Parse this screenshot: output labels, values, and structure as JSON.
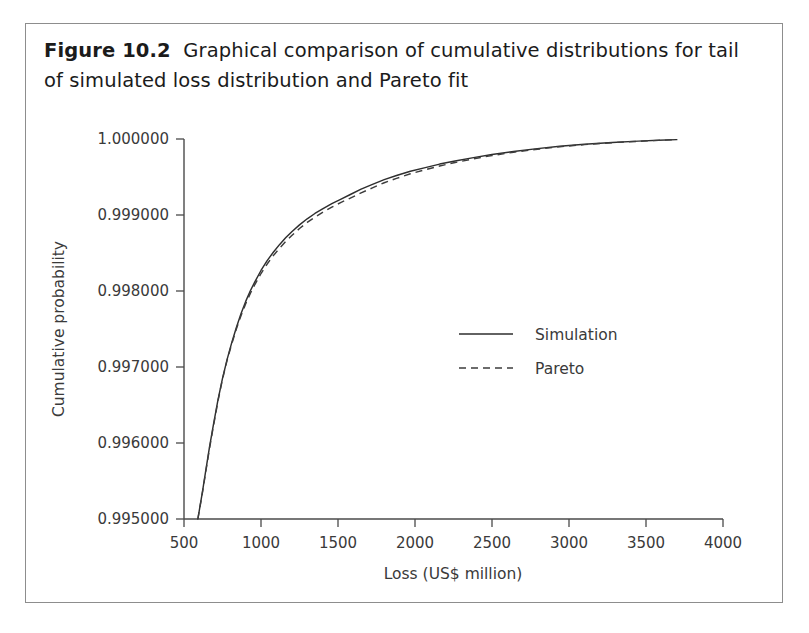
{
  "figure": {
    "caption_label": "Figure 10.2",
    "caption_text": "Graphical comparison of cumulative distributions for tail of simulated loss distribution and Pareto fit"
  },
  "chart_data": {
    "type": "line",
    "title": "",
    "xlabel": "Loss (US$ million)",
    "ylabel": "Cumulative probability",
    "xlim": [
      500,
      4000
    ],
    "ylim": [
      0.995,
      1.0
    ],
    "xticks": [
      500,
      1000,
      1500,
      2000,
      2500,
      3000,
      3500,
      4000
    ],
    "xtick_labels": [
      "500",
      "1000",
      "1500",
      "2000",
      "2500",
      "3000",
      "3500",
      "4000"
    ],
    "yticks": [
      0.995,
      0.996,
      0.997,
      0.998,
      0.999,
      1.0
    ],
    "ytick_labels": [
      "0.995000",
      "0.996000",
      "0.997000",
      "0.998000",
      "0.999000",
      "1.000000"
    ],
    "grid": false,
    "legend_position": "center-right",
    "series": [
      {
        "name": "Simulation",
        "style": "solid",
        "color": "#2e2e2e",
        "x": [
          590,
          605,
          620,
          640,
          665,
          690,
          720,
          750,
          780,
          810,
          840,
          870,
          900,
          930,
          960,
          1000,
          1040,
          1080,
          1120,
          1160,
          1200,
          1250,
          1300,
          1350,
          1400,
          1460,
          1520,
          1580,
          1650,
          1720,
          1800,
          1880,
          1970,
          2060,
          2160,
          2260,
          2380,
          2500,
          2640,
          2780,
          2940,
          3100,
          3280,
          3450,
          3580,
          3700
        ],
        "y": [
          0.995,
          0.99518,
          0.99536,
          0.99562,
          0.99594,
          0.99623,
          0.99656,
          0.99685,
          0.9971,
          0.99732,
          0.99752,
          0.9977,
          0.99786,
          0.998,
          0.99812,
          0.99827,
          0.9984,
          0.99851,
          0.99861,
          0.9987,
          0.99878,
          0.99887,
          0.99895,
          0.99902,
          0.99908,
          0.99915,
          0.99921,
          0.99927,
          0.99934,
          0.9994,
          0.999465,
          0.99952,
          0.999575,
          0.99962,
          0.99967,
          0.99971,
          0.999755,
          0.999795,
          0.999835,
          0.99987,
          0.999905,
          0.99993,
          0.999955,
          0.999972,
          0.999983,
          0.999992
        ]
      },
      {
        "name": "Pareto",
        "style": "dashed",
        "color": "#3d3d3d",
        "x": [
          590,
          605,
          620,
          640,
          665,
          690,
          720,
          750,
          780,
          810,
          840,
          870,
          900,
          930,
          960,
          1000,
          1040,
          1080,
          1120,
          1160,
          1200,
          1250,
          1300,
          1350,
          1400,
          1460,
          1520,
          1580,
          1650,
          1720,
          1800,
          1880,
          1970,
          2060,
          2160,
          2260,
          2380,
          2500,
          2640,
          2780,
          2940,
          3100,
          3280,
          3450,
          3580,
          3700
        ],
        "y": [
          0.995,
          0.995175,
          0.99535,
          0.995605,
          0.99592,
          0.99621,
          0.996545,
          0.99684,
          0.99709,
          0.997305,
          0.9975,
          0.997675,
          0.99783,
          0.997965,
          0.998085,
          0.99823,
          0.998355,
          0.998465,
          0.998562,
          0.99865,
          0.99873,
          0.998822,
          0.998902,
          0.998972,
          0.999034,
          0.999104,
          0.999166,
          0.999222,
          0.999292,
          0.999354,
          0.999424,
          0.999482,
          0.999542,
          0.999592,
          0.999645,
          0.99969,
          0.99974,
          0.999782,
          0.999826,
          0.999862,
          0.999898,
          0.999926,
          0.999952,
          0.99997,
          0.999982,
          0.999992
        ]
      }
    ],
    "legend": [
      {
        "label": "Simulation",
        "style": "solid"
      },
      {
        "label": "Pareto",
        "style": "dashed"
      }
    ]
  }
}
